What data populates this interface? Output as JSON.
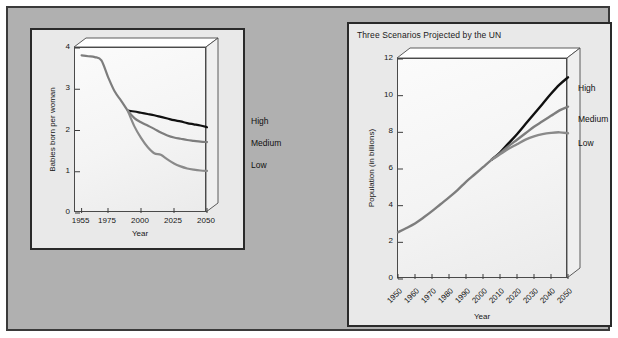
{
  "figure": {
    "background_color": "#ffffff",
    "panel_color": "#b0b0b0",
    "panel_border_color": "#3a3a3a",
    "card_color": "#e9e9e9",
    "plot_fill_color": "#f7f7f7",
    "colors": {
      "high_series": "#101010",
      "medium_series": "#7d7d7d",
      "low_series": "#8a8a8a",
      "axis": "#3c3c3c"
    }
  },
  "chart_data": [
    {
      "id": "fertility",
      "type": "line",
      "title": "",
      "xlabel": "Year",
      "ylabel": "Babies born per woman",
      "xlim": [
        1950,
        2050
      ],
      "ylim": [
        0,
        4
      ],
      "grid": false,
      "legend_position": "right-of-axes",
      "xticks": [
        1955,
        1975,
        2000,
        2025,
        2050
      ],
      "xtick_labels": [
        "1955",
        "1975",
        "2000",
        "2025",
        "2050"
      ],
      "yticks": [
        0,
        1,
        2,
        3,
        4
      ],
      "ytick_labels": [
        "0",
        "1",
        "2",
        "3",
        "4"
      ],
      "series": [
        {
          "name": "High",
          "color": "#101010",
          "x": [
            1990,
            1995,
            2000,
            2005,
            2010,
            2015,
            2020,
            2025,
            2030,
            2035,
            2040,
            2045,
            2050
          ],
          "values": [
            2.48,
            2.46,
            2.43,
            2.4,
            2.37,
            2.33,
            2.29,
            2.25,
            2.22,
            2.18,
            2.15,
            2.12,
            2.08
          ]
        },
        {
          "name": "Medium",
          "color": "#7d7d7d",
          "x": [
            1955,
            1960,
            1965,
            1970,
            1975,
            1980,
            1985,
            1990,
            1995,
            2000,
            2005,
            2010,
            2015,
            2020,
            2025,
            2030,
            2035,
            2040,
            2045,
            2050
          ],
          "values": [
            3.82,
            3.8,
            3.78,
            3.7,
            3.3,
            2.95,
            2.72,
            2.48,
            2.3,
            2.2,
            2.12,
            2.04,
            1.95,
            1.88,
            1.83,
            1.8,
            1.77,
            1.75,
            1.73,
            1.72
          ]
        },
        {
          "name": "Low",
          "color": "#8a8a8a",
          "x": [
            1990,
            1995,
            2000,
            2005,
            2010,
            2015,
            2020,
            2025,
            2030,
            2035,
            2040,
            2045,
            2050
          ],
          "values": [
            2.48,
            2.1,
            1.82,
            1.6,
            1.45,
            1.41,
            1.3,
            1.2,
            1.13,
            1.08,
            1.05,
            1.03,
            1.02
          ]
        }
      ],
      "series_labels": [
        "High",
        "Medium",
        "Low"
      ]
    },
    {
      "id": "population",
      "type": "line",
      "title": "Three Scenarios Projected by the UN",
      "xlabel": "Year",
      "ylabel": "Population (in billions)",
      "xlim": [
        1950,
        2050
      ],
      "ylim": [
        0,
        12
      ],
      "grid": false,
      "legend_position": "right-of-axes",
      "xticks": [
        1950,
        1960,
        1970,
        1980,
        1990,
        2000,
        2010,
        2020,
        2030,
        2040,
        2050
      ],
      "xtick_labels": [
        "1950",
        "1960",
        "1970",
        "1980",
        "1990",
        "2000",
        "2010",
        "2020",
        "2030",
        "2040",
        "2050"
      ],
      "yticks": [
        0,
        2,
        4,
        6,
        8,
        10,
        12
      ],
      "ytick_labels": [
        "0",
        "2",
        "4",
        "6",
        "8",
        "10",
        "12"
      ],
      "series": [
        {
          "name": "High",
          "color": "#101010",
          "x": [
            2005,
            2010,
            2015,
            2020,
            2025,
            2030,
            2035,
            2040,
            2045,
            2050
          ],
          "values": [
            6.5,
            6.9,
            7.4,
            7.9,
            8.45,
            9.0,
            9.55,
            10.1,
            10.6,
            11.0
          ]
        },
        {
          "name": "Medium",
          "color": "#7d7d7d",
          "x": [
            1950,
            1955,
            1960,
            1965,
            1970,
            1975,
            1980,
            1985,
            1990,
            1995,
            2000,
            2005,
            2010,
            2015,
            2020,
            2025,
            2030,
            2035,
            2040,
            2045,
            2050
          ],
          "values": [
            2.55,
            2.78,
            3.03,
            3.35,
            3.7,
            4.08,
            4.45,
            4.85,
            5.3,
            5.7,
            6.1,
            6.5,
            6.85,
            7.25,
            7.6,
            7.95,
            8.3,
            8.6,
            8.9,
            9.2,
            9.4
          ]
        },
        {
          "name": "Low",
          "color": "#8a8a8a",
          "x": [
            2005,
            2010,
            2015,
            2020,
            2025,
            2030,
            2035,
            2040,
            2045,
            2050
          ],
          "values": [
            6.5,
            6.8,
            7.1,
            7.35,
            7.6,
            7.78,
            7.9,
            7.97,
            8.0,
            7.95
          ]
        }
      ],
      "series_labels": [
        "High",
        "Medium",
        "Low"
      ]
    }
  ]
}
